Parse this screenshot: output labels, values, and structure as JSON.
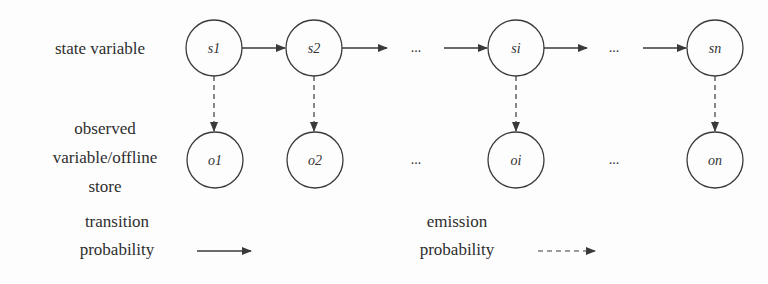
{
  "labels": {
    "state_variable": "state variable",
    "observed_line1": "observed",
    "observed_line2": "variable/offline",
    "observed_line3": "store",
    "transition_line1": "transition",
    "transition_line2": "probability",
    "emission_line1": "emission",
    "emission_line2": "probability"
  },
  "state_nodes": [
    {
      "id": "s1",
      "label": "s1"
    },
    {
      "id": "s2",
      "label": "s2"
    },
    {
      "id": "si",
      "label": "si"
    },
    {
      "id": "sn",
      "label": "sn"
    }
  ],
  "observed_nodes": [
    {
      "id": "o1",
      "label": "o1"
    },
    {
      "id": "o2",
      "label": "o2"
    },
    {
      "id": "oi",
      "label": "oi"
    },
    {
      "id": "on",
      "label": "on"
    }
  ],
  "ellipsis": "...",
  "legend": {
    "transition": "solid arrow",
    "emission": "dashed arrow"
  },
  "colors": {
    "stroke": "#3a3a3a",
    "text": "#2e2e2e",
    "background": "#fdfdfd"
  }
}
